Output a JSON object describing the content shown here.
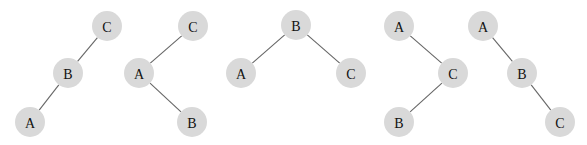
{
  "diagram": {
    "title": "",
    "node_radius": 15,
    "node_fill": "#d9d9d9",
    "edge_color": "#666666",
    "trees": [
      {
        "id": "tree-1",
        "nodes": [
          {
            "id": "C",
            "label": "C",
            "x": 107,
            "y": 26
          },
          {
            "id": "B",
            "label": "B",
            "x": 68,
            "y": 73
          },
          {
            "id": "A",
            "label": "A",
            "x": 30,
            "y": 122
          }
        ],
        "edges": [
          [
            "C",
            "B"
          ],
          [
            "B",
            "A"
          ]
        ]
      },
      {
        "id": "tree-2",
        "nodes": [
          {
            "id": "C",
            "label": "C",
            "x": 193,
            "y": 26
          },
          {
            "id": "A",
            "label": "A",
            "x": 139,
            "y": 73
          },
          {
            "id": "B",
            "label": "B",
            "x": 192,
            "y": 122
          }
        ],
        "edges": [
          [
            "C",
            "A"
          ],
          [
            "A",
            "B"
          ]
        ]
      },
      {
        "id": "tree-3",
        "nodes": [
          {
            "id": "B",
            "label": "B",
            "x": 296,
            "y": 25
          },
          {
            "id": "A",
            "label": "A",
            "x": 241,
            "y": 73
          },
          {
            "id": "C",
            "label": "C",
            "x": 351,
            "y": 73
          }
        ],
        "edges": [
          [
            "B",
            "A"
          ],
          [
            "B",
            "C"
          ]
        ]
      },
      {
        "id": "tree-4",
        "nodes": [
          {
            "id": "A",
            "label": "A",
            "x": 399,
            "y": 26
          },
          {
            "id": "C",
            "label": "C",
            "x": 453,
            "y": 73
          },
          {
            "id": "B",
            "label": "B",
            "x": 399,
            "y": 122
          }
        ],
        "edges": [
          [
            "A",
            "C"
          ],
          [
            "C",
            "B"
          ]
        ]
      },
      {
        "id": "tree-5",
        "nodes": [
          {
            "id": "A",
            "label": "A",
            "x": 483,
            "y": 26
          },
          {
            "id": "B",
            "label": "B",
            "x": 522,
            "y": 73
          },
          {
            "id": "C",
            "label": "C",
            "x": 560,
            "y": 122
          }
        ],
        "edges": [
          [
            "A",
            "B"
          ],
          [
            "B",
            "C"
          ]
        ]
      }
    ]
  }
}
